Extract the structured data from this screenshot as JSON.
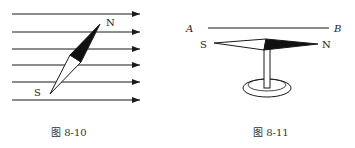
{
  "figures": [
    {
      "caption": "图 8-10",
      "labels": {
        "north": "N",
        "south": "S"
      },
      "field_lines": [
        14,
        32,
        49,
        65,
        82,
        100
      ]
    },
    {
      "caption": "图 8-11",
      "labels": {
        "a": "A",
        "b": "B",
        "north": "N",
        "south": "S"
      }
    }
  ],
  "colors": {
    "ink": "#1a1a1a",
    "fill": "#111111"
  }
}
